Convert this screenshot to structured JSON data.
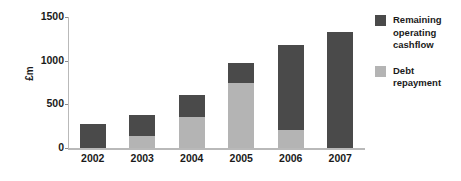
{
  "chart_data": {
    "type": "bar",
    "title": "",
    "subtitle": "",
    "xlabel": "",
    "ylabel": "£m",
    "categories": [
      "2002",
      "2003",
      "2004",
      "2005",
      "2006",
      "2007"
    ],
    "series": [
      {
        "name": "Debt repayment",
        "color": "#b4b4b4",
        "values": [
          0,
          140,
          360,
          750,
          210,
          0
        ]
      },
      {
        "name": "Remaining operating cashflow",
        "color": "#4a4a4a",
        "values": [
          270,
          240,
          250,
          220,
          965,
          1325
        ]
      }
    ],
    "totals": [
      270,
      380,
      610,
      970,
      1175,
      1325
    ],
    "stacked": true,
    "stack_order": [
      "Debt repayment",
      "Remaining operating cashflow"
    ],
    "ylim": [
      0,
      1500
    ],
    "yticks": [
      0,
      500,
      1000,
      1500
    ],
    "ytick_labels": [
      "0",
      "500",
      "1000",
      "1500"
    ],
    "grid": false,
    "legend_position": "right",
    "legend": [
      {
        "label": "Remaining\noperating\ncashflow",
        "color": "#4a4a4a",
        "swatch_name": "legend-swatch-remaining-operating-cashflow"
      },
      {
        "label": "Debt\nrepayment",
        "color": "#b4b4b4",
        "swatch_name": "legend-swatch-debt-repayment"
      }
    ]
  },
  "colors": {
    "dark": "#4a4a4a",
    "light": "#b4b4b4",
    "axis": "#b9b9b9",
    "text": "#1a1a1a",
    "background": "#ffffff"
  }
}
